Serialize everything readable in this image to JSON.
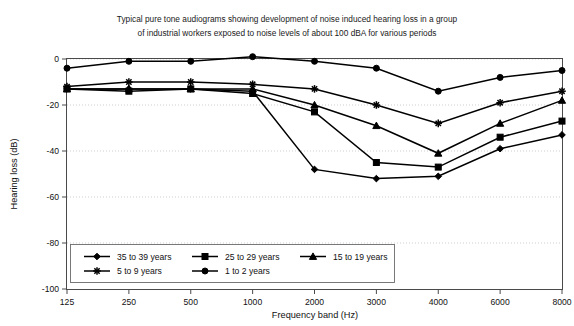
{
  "chart_data": {
    "type": "line",
    "title": "Typical pure tone audiograms showing development of noise induced hearing loss in a group of industrial workers exposed to noise levels of about 100 dBA for various periods",
    "title_line1": "Typical pure tone audiograms showing development of noise induced hearing loss in a group",
    "title_line2": "of industrial workers exposed to noise levels of about 100 dBA for various periods",
    "xlabel": "Frequency band (Hz)",
    "ylabel": "Hearing loss (dB)",
    "categories": [
      125,
      250,
      500,
      1000,
      2000,
      3000,
      4000,
      6000,
      8000
    ],
    "xtick_labels": [
      "125",
      "250",
      "500",
      "1000",
      "2000",
      "3000",
      "4000",
      "6000",
      "8000"
    ],
    "ytick_labels": [
      "0",
      "-20",
      "-40",
      "-60",
      "-80",
      "-100"
    ],
    "ytick_values": [
      0,
      -20,
      -40,
      -60,
      -80,
      -100
    ],
    "ylim": [
      -100,
      0
    ],
    "grid": true,
    "legend_position": "bottom-left-inside",
    "series": [
      {
        "name": "35 to 39 years",
        "marker": "diamond",
        "values": [
          -13,
          -13,
          -13,
          -14,
          -48,
          -52,
          -51,
          -39,
          -33
        ]
      },
      {
        "name": "25 to 29 years",
        "marker": "square",
        "values": [
          -13,
          -14,
          -13,
          -15,
          -23,
          -45,
          -47,
          -34,
          -27
        ]
      },
      {
        "name": "15 to 19 years",
        "marker": "triangle",
        "values": [
          -13,
          -13,
          -13,
          -13,
          -20,
          -29,
          -41,
          -28,
          -18
        ]
      },
      {
        "name": "5 to 9 years",
        "marker": "star",
        "values": [
          -12,
          -10,
          -10,
          -11,
          -13,
          -20,
          -28,
          -19,
          -14
        ]
      },
      {
        "name": "1 to 2 years",
        "marker": "circle",
        "values": [
          -4,
          -1,
          -1,
          1,
          -1,
          -4,
          -14,
          -8,
          -5
        ]
      }
    ]
  },
  "colors": {
    "line": "#000000",
    "grid": "#b9b9b9",
    "frame": "#4a4a4a",
    "background": "#ffffff"
  }
}
